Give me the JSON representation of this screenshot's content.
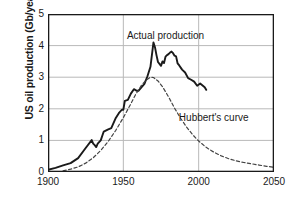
{
  "chart_data": {
    "type": "line",
    "title": "",
    "xlabel": "",
    "ylabel": "US oil production (Gb/year)",
    "xlim": [
      1900,
      2050
    ],
    "ylim": [
      0,
      5
    ],
    "xticks": [
      1900,
      1950,
      2000,
      2050
    ],
    "yticks": [
      0,
      1,
      2,
      3,
      4,
      5
    ],
    "grid": "horizontal and vertical gridlines at tick values",
    "legend_position": "inline annotations next to curves",
    "annotations": [
      {
        "text": "Actual production",
        "x": 1978,
        "y": 4.35
      },
      {
        "text": "Hubbert's curve",
        "x": 2010,
        "y": 1.75
      }
    ],
    "series": [
      {
        "name": "Actual production",
        "style": "solid",
        "color": "#1a1a1a",
        "x": [
          1900,
          1905,
          1910,
          1915,
          1920,
          1925,
          1929,
          1930,
          1931,
          1932,
          1933,
          1935,
          1937,
          1940,
          1942,
          1945,
          1947,
          1949,
          1950,
          1951,
          1953,
          1955,
          1957,
          1959,
          1960,
          1962,
          1964,
          1966,
          1968,
          1970,
          1971,
          1972,
          1973,
          1974,
          1975,
          1976,
          1977,
          1978,
          1979,
          1980,
          1981,
          1982,
          1983,
          1984,
          1985,
          1986,
          1987,
          1989,
          1991,
          1993,
          1995,
          1997,
          1999,
          2001,
          2003,
          2004,
          2005
        ],
        "y": [
          0.07,
          0.13,
          0.21,
          0.28,
          0.44,
          0.76,
          1.01,
          0.9,
          0.85,
          0.79,
          0.9,
          1.0,
          1.28,
          1.35,
          1.39,
          1.71,
          1.86,
          1.97,
          1.97,
          2.25,
          2.28,
          2.48,
          2.62,
          2.57,
          2.57,
          2.68,
          2.79,
          3.03,
          3.33,
          4.1,
          3.95,
          3.7,
          3.48,
          3.42,
          3.36,
          3.5,
          3.45,
          3.65,
          3.7,
          3.73,
          3.78,
          3.81,
          3.76,
          3.68,
          3.66,
          3.44,
          3.38,
          3.24,
          3.15,
          2.97,
          2.92,
          2.86,
          2.73,
          2.8,
          2.72,
          2.68,
          2.6
        ]
      },
      {
        "name": "Hubbert's curve",
        "style": "dashed",
        "color": "#444444",
        "x": [
          1910,
          1915,
          1920,
          1925,
          1930,
          1935,
          1940,
          1945,
          1950,
          1955,
          1958,
          1962,
          1965,
          1968,
          1970,
          1973,
          1976,
          1980,
          1984,
          1988,
          1992,
          1996,
          2000,
          2005,
          2010,
          2015,
          2020,
          2025,
          2030,
          2035,
          2040,
          2045,
          2050
        ],
        "y": [
          0.04,
          0.09,
          0.16,
          0.28,
          0.45,
          0.68,
          0.97,
          1.32,
          1.72,
          2.16,
          2.44,
          2.74,
          2.9,
          3.0,
          2.99,
          2.88,
          2.7,
          2.38,
          2.02,
          1.7,
          1.42,
          1.18,
          0.98,
          0.78,
          0.63,
          0.51,
          0.42,
          0.35,
          0.3,
          0.26,
          0.22,
          0.18,
          0.15
        ]
      }
    ]
  }
}
